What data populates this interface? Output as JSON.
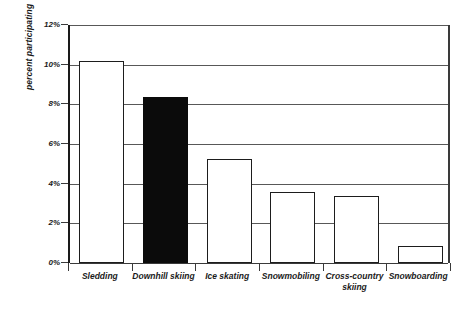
{
  "chart_data": {
    "type": "bar",
    "title": "",
    "xlabel": "",
    "ylabel": "percent participating",
    "categories": [
      "Sledding",
      "Downhill skiing",
      "Ice skating",
      "Snowmobiling",
      "Cross-country skiing",
      "Snowboarding"
    ],
    "values": [
      10.2,
      8.35,
      5.25,
      3.6,
      3.4,
      0.85
    ],
    "ylim": [
      0,
      12
    ],
    "ytick_values": [
      0,
      2,
      4,
      6,
      8,
      10,
      12
    ],
    "ytick_labels": [
      "0%",
      "2%",
      "4%",
      "6%",
      "8%",
      "10%",
      "12%"
    ],
    "grid": true,
    "legend": false,
    "bar_styles": [
      "open",
      "filled",
      "open",
      "open",
      "open",
      "open"
    ],
    "colors": {
      "bar_fill_open": "#ffffff",
      "bar_fill_filled": "#0b0b0b",
      "bar_edge": "#1d1d1d",
      "gridline": "#585858",
      "axis": "#1a1a1a",
      "text": "#1a1a1a",
      "background": "#ffffff"
    }
  }
}
